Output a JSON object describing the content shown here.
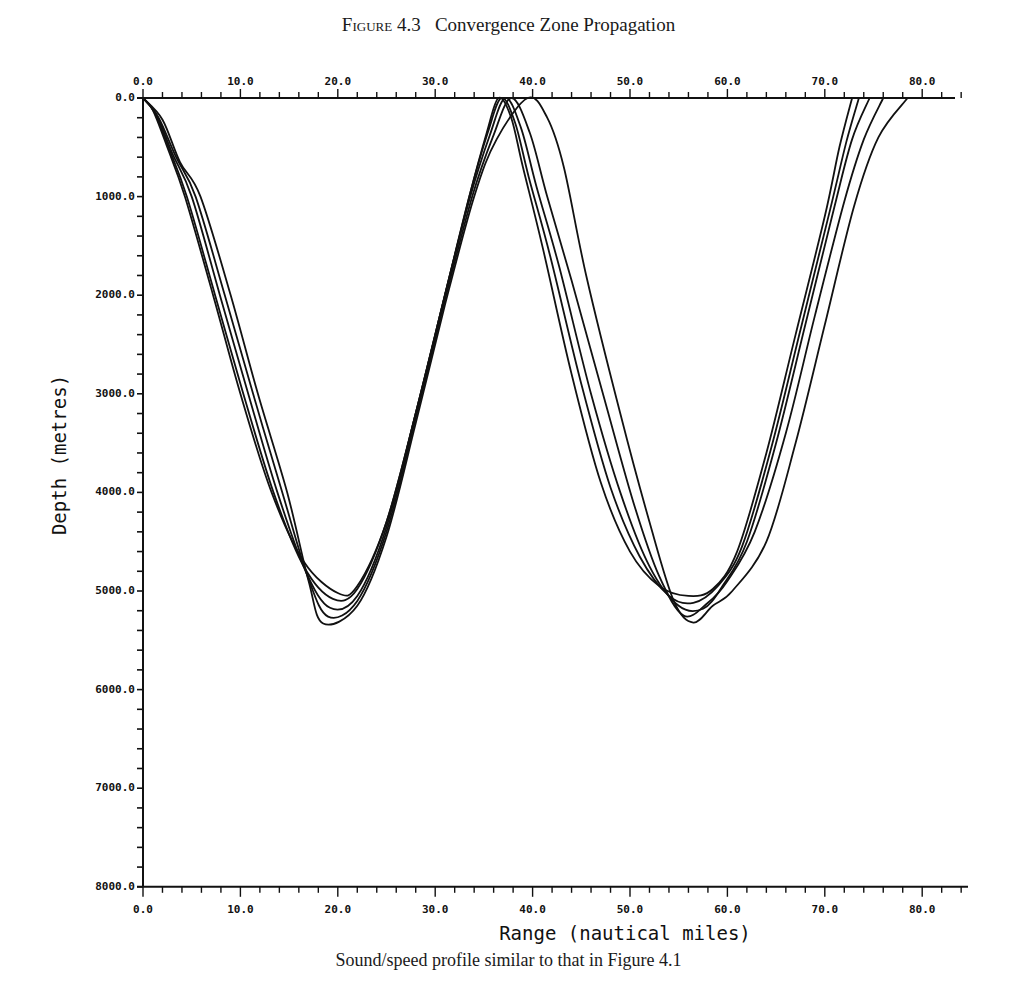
{
  "figure": {
    "label_prefix": "Figure",
    "number": "4.3",
    "title": "Convergence Zone Propagation",
    "caption": "Sound/speed profile similar to that in Figure 4.1"
  },
  "chart_data": {
    "type": "line",
    "subtitle": "Sound/speed profile similar to that in Figure 4.1",
    "xlabel": "Range (nautical miles)",
    "ylabel": "Depth (metres)",
    "xlim": [
      0,
      85
    ],
    "ylim": [
      8000,
      0
    ],
    "y_inverted": true,
    "grid": false,
    "legend": null,
    "x_ticks": [
      "0.0",
      "10.0",
      "20.0",
      "30.0",
      "40.0",
      "50.0",
      "60.0",
      "70.0",
      "80.0"
    ],
    "y_ticks": [
      "0.0",
      "1000.0",
      "2000.0",
      "3000.0",
      "4000.0",
      "5000.0",
      "6000.0",
      "7000.0",
      "8000.0"
    ],
    "x_minor_step": 2,
    "y_minor_step": 200,
    "series": [
      {
        "name": "ray-1",
        "points": [
          [
            0,
            0
          ],
          [
            1,
            120
          ],
          [
            2.5,
            500
          ],
          [
            4.3,
            1000
          ],
          [
            7.2,
            2000
          ],
          [
            10,
            3000
          ],
          [
            13.2,
            4000
          ],
          [
            16.5,
            4700
          ],
          [
            20,
            5020
          ],
          [
            22,
            4950
          ],
          [
            25,
            4300
          ],
          [
            28,
            3200
          ],
          [
            31,
            2000
          ],
          [
            33.5,
            1000
          ],
          [
            35.3,
            350
          ],
          [
            36.5,
            0
          ],
          [
            37.8,
            200
          ],
          [
            39,
            700
          ],
          [
            41,
            1500
          ],
          [
            44,
            2800
          ],
          [
            47,
            3900
          ],
          [
            50,
            4600
          ],
          [
            53,
            4950
          ],
          [
            56,
            5050
          ],
          [
            58.5,
            4980
          ],
          [
            61,
            4600
          ],
          [
            64,
            3600
          ],
          [
            67,
            2400
          ],
          [
            70,
            1200
          ],
          [
            71.5,
            500
          ],
          [
            72.8,
            0
          ]
        ]
      },
      {
        "name": "ray-2",
        "points": [
          [
            0,
            0
          ],
          [
            1.2,
            150
          ],
          [
            2.7,
            520
          ],
          [
            4.5,
            1000
          ],
          [
            7.4,
            2000
          ],
          [
            10.3,
            3000
          ],
          [
            13.4,
            4000
          ],
          [
            16.5,
            4750
          ],
          [
            19.5,
            5080
          ],
          [
            22,
            4980
          ],
          [
            25,
            4300
          ],
          [
            28,
            3200
          ],
          [
            31,
            2000
          ],
          [
            33.5,
            1000
          ],
          [
            35.4,
            350
          ],
          [
            36.8,
            0
          ],
          [
            38.2,
            250
          ],
          [
            39.6,
            800
          ],
          [
            41.8,
            1600
          ],
          [
            45,
            2900
          ],
          [
            48,
            3950
          ],
          [
            51,
            4650
          ],
          [
            54,
            5050
          ],
          [
            56.5,
            5120
          ],
          [
            59,
            4950
          ],
          [
            61.5,
            4550
          ],
          [
            64.5,
            3550
          ],
          [
            67.5,
            2350
          ],
          [
            70.5,
            1150
          ],
          [
            72.2,
            450
          ],
          [
            73.5,
            0
          ]
        ]
      },
      {
        "name": "ray-3",
        "points": [
          [
            0,
            0
          ],
          [
            1.4,
            170
          ],
          [
            3,
            560
          ],
          [
            5,
            1000
          ],
          [
            7.9,
            2000
          ],
          [
            10.8,
            3000
          ],
          [
            13.8,
            4000
          ],
          [
            16.7,
            4800
          ],
          [
            19.2,
            5170
          ],
          [
            22,
            5050
          ],
          [
            25,
            4350
          ],
          [
            28,
            3200
          ],
          [
            31,
            2000
          ],
          [
            33.6,
            1000
          ],
          [
            35.6,
            380
          ],
          [
            37.2,
            0
          ],
          [
            38.8,
            300
          ],
          [
            40.4,
            900
          ],
          [
            42.7,
            1700
          ],
          [
            46,
            3000
          ],
          [
            49,
            4000
          ],
          [
            52,
            4750
          ],
          [
            55,
            5150
          ],
          [
            57.5,
            5180
          ],
          [
            59.5,
            4950
          ],
          [
            62,
            4500
          ],
          [
            65,
            3500
          ],
          [
            68,
            2300
          ],
          [
            71,
            1100
          ],
          [
            72.8,
            420
          ],
          [
            74.6,
            0
          ]
        ]
      },
      {
        "name": "ray-4",
        "points": [
          [
            0,
            0
          ],
          [
            1.6,
            200
          ],
          [
            3.4,
            600
          ],
          [
            5.4,
            1000
          ],
          [
            8.4,
            2000
          ],
          [
            11.3,
            3000
          ],
          [
            14.3,
            4000
          ],
          [
            16.9,
            4850
          ],
          [
            19,
            5260
          ],
          [
            22,
            5100
          ],
          [
            25,
            4400
          ],
          [
            28,
            3250
          ],
          [
            31,
            2050
          ],
          [
            33.8,
            1000
          ],
          [
            35.9,
            400
          ],
          [
            37.8,
            0
          ],
          [
            39.7,
            350
          ],
          [
            41.5,
            1000
          ],
          [
            44,
            1850
          ],
          [
            47.5,
            3100
          ],
          [
            50.5,
            4150
          ],
          [
            53,
            4850
          ],
          [
            55.5,
            5250
          ],
          [
            58,
            5120
          ],
          [
            60,
            4900
          ],
          [
            62.8,
            4400
          ],
          [
            66,
            3400
          ],
          [
            69,
            2200
          ],
          [
            72,
            1050
          ],
          [
            74,
            420
          ],
          [
            76,
            0
          ]
        ]
      },
      {
        "name": "ray-5",
        "points": [
          [
            0,
            0
          ],
          [
            2,
            220
          ],
          [
            3.8,
            650
          ],
          [
            5.9,
            1000
          ],
          [
            9,
            2000
          ],
          [
            11.8,
            3000
          ],
          [
            14.8,
            4000
          ],
          [
            17,
            4900
          ],
          [
            18.5,
            5330
          ],
          [
            22,
            5150
          ],
          [
            25,
            4450
          ],
          [
            28,
            3300
          ],
          [
            31,
            2100
          ],
          [
            34,
            1000
          ],
          [
            36.3,
            420
          ],
          [
            39.5,
            0
          ],
          [
            41.5,
            200
          ],
          [
            43.2,
            700
          ],
          [
            45.5,
            1800
          ],
          [
            49,
            3200
          ],
          [
            52,
            4300
          ],
          [
            54.5,
            5100
          ],
          [
            56.5,
            5320
          ],
          [
            58.5,
            5150
          ],
          [
            60.5,
            5000
          ],
          [
            64,
            4500
          ],
          [
            67,
            3500
          ],
          [
            70,
            2300
          ],
          [
            73,
            1100
          ],
          [
            75.5,
            400
          ],
          [
            78.5,
            0
          ]
        ]
      }
    ]
  },
  "axes": {
    "x_label": "Range (nautical miles)",
    "y_label": "Depth (metres)",
    "x_ticks": [
      "0.0",
      "10.0",
      "20.0",
      "30.0",
      "40.0",
      "50.0",
      "60.0",
      "70.0",
      "80.0"
    ],
    "y_ticks": [
      "0.0",
      "1000.0",
      "2000.0",
      "3000.0",
      "4000.0",
      "5000.0",
      "6000.0",
      "7000.0",
      "8000.0"
    ],
    "line_color": "#111111"
  }
}
